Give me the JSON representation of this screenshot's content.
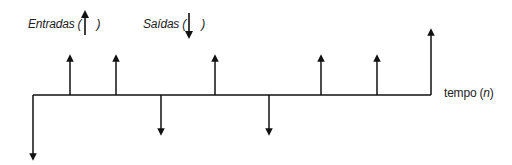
{
  "legend": {
    "inflows_label": "Entradas (",
    "inflows_close": ")",
    "outflows_label": "Saídas (",
    "outflows_close": ")"
  },
  "axis": {
    "label_prefix": "tempo (",
    "label_var": "n",
    "label_suffix": ")"
  },
  "colors": {
    "line": "#111111",
    "background": "#ffffff"
  },
  "cash_flows": [
    {
      "position": 0,
      "x": 33,
      "direction": "down",
      "size": "large"
    },
    {
      "position": 1,
      "x": 70,
      "direction": "up",
      "size": "medium"
    },
    {
      "position": 2,
      "x": 116,
      "direction": "up",
      "size": "medium"
    },
    {
      "position": 3,
      "x": 161,
      "direction": "down",
      "size": "medium"
    },
    {
      "position": 4,
      "x": 215,
      "direction": "up",
      "size": "medium"
    },
    {
      "position": 5,
      "x": 269,
      "direction": "down",
      "size": "medium"
    },
    {
      "position": 6,
      "x": 321,
      "direction": "up",
      "size": "medium"
    },
    {
      "position": 7,
      "x": 377,
      "direction": "up",
      "size": "medium"
    },
    {
      "position": 8,
      "x": 431,
      "direction": "up",
      "size": "large"
    }
  ]
}
